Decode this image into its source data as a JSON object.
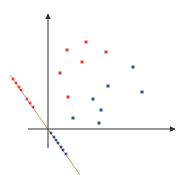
{
  "diagram": {
    "type": "projection-onto-line",
    "colors": {
      "axis": "#333333",
      "projection_line": "#e0906a",
      "class_a": "#e04040",
      "class_b": "#2f5496"
    },
    "origin": [
      48,
      129
    ],
    "axes": {
      "y": {
        "from": [
          48,
          148
        ],
        "to": [
          48,
          14
        ]
      },
      "x": {
        "from": [
          28,
          129
        ],
        "to": [
          175,
          129
        ]
      }
    },
    "projection_line": {
      "from": [
        10,
        75
      ],
      "to": [
        80,
        175
      ]
    },
    "class_a_points": [
      [
        67,
        50
      ],
      [
        86,
        42
      ],
      [
        106,
        52
      ],
      [
        82,
        62
      ],
      [
        60,
        73
      ],
      [
        68,
        97
      ]
    ],
    "class_b_points": [
      [
        133,
        67
      ],
      [
        142,
        92
      ],
      [
        108,
        86
      ],
      [
        93,
        99
      ],
      [
        101,
        110
      ],
      [
        73,
        118
      ],
      [
        99,
        123
      ]
    ],
    "class_a_projected": [
      [
        13,
        79
      ],
      [
        16,
        83
      ],
      [
        19,
        87
      ],
      [
        21,
        90
      ],
      [
        27,
        99
      ],
      [
        30,
        103
      ],
      [
        33,
        107
      ]
    ],
    "class_b_projected": [
      [
        51,
        133
      ],
      [
        54,
        137
      ],
      [
        56,
        140
      ],
      [
        58,
        143
      ],
      [
        61,
        147
      ],
      [
        63,
        150
      ],
      [
        66,
        154
      ]
    ]
  }
}
